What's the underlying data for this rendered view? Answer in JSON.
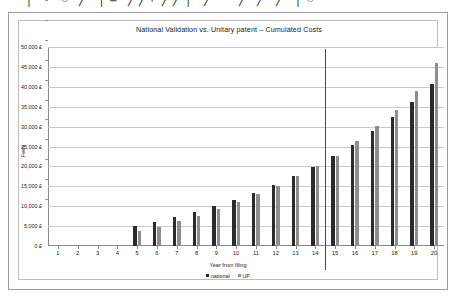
{
  "top_strip": {
    "text": "— │— ○ ╱ │≡ ╱╱⌐╱╱│ ╱— ╱ ╱ ╱ │○"
  },
  "frame": {
    "outer_border_color": "#9a9a9a",
    "inner_border_color": "#bdbdbd",
    "background": "#ffffff"
  },
  "colors": {
    "national": "#2b2b2b",
    "up": "#8e8e8e",
    "gridline": "#c9c9c9",
    "axis": "#8a8a8a",
    "divider": "#4a4a4a",
    "text": "#1a1a1a"
  },
  "chart_data": {
    "type": "bar",
    "title": "National Validation vs. Unitary patent – Cumulated Costs",
    "xlabel": "Year from filing",
    "ylabel": "Fees",
    "categories": [
      "1",
      "2",
      "3",
      "4",
      "5",
      "6",
      "7",
      "8",
      "9",
      "10",
      "11",
      "12",
      "13",
      "14",
      "15",
      "16",
      "17",
      "18",
      "19",
      "20"
    ],
    "ylim": [
      0,
      50000
    ],
    "ytick_step": 5000,
    "ytick_labels": [
      "0 £",
      "5,000 £",
      "10,000 £",
      "15,000 £",
      "20,000 £",
      "25,000 £",
      "30,000 £",
      "35,000 £",
      "40,000 £",
      "45,000 £",
      "50,000 £"
    ],
    "ytick_values": [
      0,
      5000,
      10000,
      15000,
      20000,
      25000,
      30000,
      35000,
      40000,
      45000,
      50000
    ],
    "grid": true,
    "legend_position": "bottom",
    "series": [
      {
        "name": "national",
        "color": "#2b2b2b",
        "values": [
          0,
          0,
          0,
          0,
          5000,
          6100,
          7300,
          8600,
          10000,
          11600,
          13400,
          15300,
          17500,
          19800,
          22500,
          25500,
          28800,
          32400,
          36300,
          40700
        ]
      },
      {
        "name": "UP",
        "color": "#8e8e8e",
        "values": [
          0,
          0,
          0,
          0,
          3800,
          4900,
          6200,
          7600,
          9200,
          11000,
          13000,
          15200,
          17700,
          20000,
          22700,
          26300,
          30100,
          34300,
          39000,
          46000
        ]
      }
    ],
    "annotations": [
      {
        "type": "vertical-line",
        "between_categories": [
          "14",
          "15"
        ],
        "color": "#4a4a4a"
      }
    ]
  },
  "legend": {
    "items": [
      {
        "label": "national",
        "color": "#2b2b2b"
      },
      {
        "label": "UP",
        "color": "#8e8e8e"
      }
    ]
  }
}
